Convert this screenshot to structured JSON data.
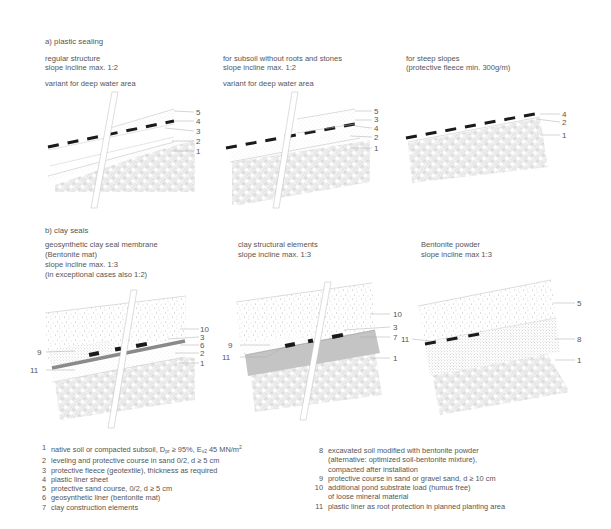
{
  "sections": {
    "a": {
      "title": "a) plastic sealing",
      "panels": [
        {
          "line1": "regular structure",
          "line2": "slope incline max. 1:2",
          "variant": "variant for deep water area",
          "labels": [
            "5",
            "4",
            "3",
            "2",
            "1"
          ]
        },
        {
          "line1": "for subsoil without roots and stones",
          "line2": "slope incline max. 1:2",
          "variant": "variant for deep water area",
          "labels": [
            "5",
            "3",
            "4",
            "2",
            "1"
          ]
        },
        {
          "line1": "for steep slopes",
          "line2": "(protective fleece min. 300g/m)",
          "labels": [
            "4",
            "2",
            "1"
          ]
        }
      ]
    },
    "b": {
      "title": "b) clay seals",
      "panels": [
        {
          "line1": "geosynthetic clay seal membrane",
          "line2": "(Bentonite mat)",
          "line3": "slope incline max. 1:3",
          "line4": "(in exceptional cases also 1:2)",
          "labels_right": [
            "10",
            "3",
            "6",
            "2",
            "1"
          ],
          "labels_left": [
            "9",
            "11"
          ]
        },
        {
          "line1": "clay structural elements",
          "line2": "slope incline max. 1:3",
          "labels_right": [
            "10",
            "3",
            "7",
            "1"
          ],
          "labels_left": [
            "9",
            "11"
          ]
        },
        {
          "line1": "Bentonite powder",
          "line2": "slope incline max 1:3",
          "labels_right": [
            "5",
            "8",
            "1"
          ],
          "labels_left": [
            "11"
          ]
        }
      ]
    }
  },
  "legend": {
    "left": [
      {
        "num": "1",
        "text_a": "native soil or compacted subsoil, D",
        "sub_a": "pr",
        "text_b": " ≥ 95%, E",
        "sub_b": "v2",
        "text_c": " 45 MN/m",
        "sup_c": "2"
      },
      {
        "num": "2",
        "text": "leveling and protective course in sand 0/2, d ≥ 5 cm"
      },
      {
        "num": "3",
        "text": "protective fleece (geotextile), thickness as required"
      },
      {
        "num": "4",
        "text": "plastic liner sheet"
      },
      {
        "num": "5",
        "text": "protective sand course, 0/2, d ≥ 5 cm"
      },
      {
        "num": "6",
        "text": "geosynthetic liner (bentonite mat)"
      },
      {
        "num": "7",
        "text": "clay construction elements"
      }
    ],
    "right": [
      {
        "num": "8",
        "text": "excavated soil modified with bentonite powder",
        "cont": [
          "(alternative: optimized soil-bentonite mixture),",
          "compacted after installation"
        ]
      },
      {
        "num": "9",
        "text": "protective course in sand or gravel sand, d ≥ 10 cm"
      },
      {
        "num": "10",
        "text": "additional pond substrate load (humus free)",
        "cont": [
          "of loose mineral material"
        ]
      },
      {
        "num": "11",
        "text": "plastic liner as root protection in planned planting area"
      }
    ]
  },
  "colors": {
    "line": "#9a9a9a",
    "liner": "#1a1a1a",
    "clay": "#c4c4c4",
    "bentonite_mat": "#8a8a8a",
    "text": "#555555"
  }
}
